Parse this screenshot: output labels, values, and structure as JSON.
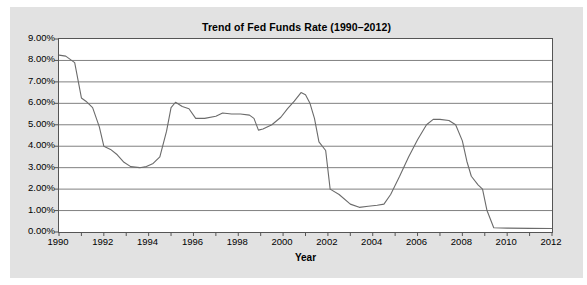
{
  "chart_data": {
    "type": "line",
    "title": "Trend of Fed Funds Rate (1990–2012)",
    "xlabel": "Year",
    "ylabel": "",
    "xlim": [
      1990,
      2012
    ],
    "ylim": [
      0.0,
      9.0
    ],
    "grid": true,
    "legend": false,
    "y_tick_labels": [
      "0.00%",
      "1.00%",
      "2.00%",
      "3.00%",
      "4.00%",
      "5.00%",
      "6.00%",
      "7.00%",
      "8.00%",
      "9.00%"
    ],
    "y_tick_values": [
      0,
      1,
      2,
      3,
      4,
      5,
      6,
      7,
      8,
      9
    ],
    "x_tick_labels": [
      "1990",
      "1992",
      "1994",
      "1996",
      "1998",
      "2000",
      "2002",
      "2004",
      "2006",
      "2008",
      "2010",
      "2012"
    ],
    "x_tick_values": [
      1990,
      1992,
      1994,
      1996,
      1998,
      2000,
      2002,
      2004,
      2006,
      2008,
      2010,
      2012
    ],
    "x_minor_ticks": [
      1991,
      1993,
      1995,
      1997,
      1999,
      2001,
      2003,
      2005,
      2007,
      2009,
      2011
    ],
    "series": [
      {
        "name": "Fed Funds Rate",
        "color": "#6b6b6b",
        "x": [
          1990.0,
          1990.3,
          1990.7,
          1991.0,
          1991.2,
          1991.5,
          1991.8,
          1992.0,
          1992.3,
          1992.6,
          1992.9,
          1993.2,
          1993.6,
          1993.9,
          1994.2,
          1994.5,
          1994.8,
          1995.0,
          1995.2,
          1995.5,
          1995.8,
          1996.1,
          1996.5,
          1997.0,
          1997.3,
          1997.7,
          1998.1,
          1998.5,
          1998.7,
          1998.9,
          1999.1,
          1999.5,
          1999.9,
          2000.2,
          2000.5,
          2000.8,
          2001.0,
          2001.2,
          2001.4,
          2001.6,
          2001.9,
          2002.1,
          2002.5,
          2003.0,
          2003.4,
          2003.8,
          2004.2,
          2004.5,
          2004.8,
          2005.2,
          2005.6,
          2006.0,
          2006.4,
          2006.7,
          2007.0,
          2007.4,
          2007.7,
          2008.0,
          2008.2,
          2008.4,
          2008.7,
          2008.9,
          2009.1,
          2009.4,
          2010.0,
          2011.0,
          2012.0
        ],
        "y": [
          8.25,
          8.2,
          7.9,
          6.25,
          6.1,
          5.8,
          4.9,
          4.0,
          3.85,
          3.6,
          3.25,
          3.05,
          3.0,
          3.05,
          3.2,
          3.5,
          4.7,
          5.8,
          6.05,
          5.85,
          5.75,
          5.3,
          5.3,
          5.4,
          5.55,
          5.5,
          5.5,
          5.45,
          5.3,
          4.75,
          4.8,
          5.0,
          5.35,
          5.75,
          6.1,
          6.5,
          6.4,
          6.0,
          5.3,
          4.2,
          3.8,
          2.0,
          1.75,
          1.3,
          1.15,
          1.2,
          1.25,
          1.3,
          1.75,
          2.6,
          3.5,
          4.3,
          5.0,
          5.25,
          5.25,
          5.2,
          5.0,
          4.25,
          3.3,
          2.6,
          2.2,
          2.0,
          1.0,
          0.2,
          0.18,
          0.17,
          0.16
        ]
      }
    ],
    "annotations": []
  }
}
